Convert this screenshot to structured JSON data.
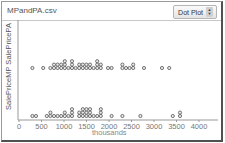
{
  "window": {
    "title": "MPandPA.csv",
    "plot_type_select": {
      "selected": "Dot Plot"
    }
  },
  "chart_data": {
    "type": "scatter",
    "subtype": "dot plot (two stacked attributes)",
    "title": "MPandPA.csv",
    "xlabel": "thousands",
    "ylabel": "SalePriceMP SalePricePA",
    "xlim": [
      0,
      4000
    ],
    "x_ticks": [
      0,
      500,
      1000,
      1500,
      2000,
      2500,
      3000,
      3500,
      4000
    ],
    "grid": false,
    "series": [
      {
        "name": "SalePricePA",
        "values": [
          300,
          500,
          700,
          750,
          800,
          850,
          850,
          900,
          950,
          1000,
          1000,
          1050,
          1100,
          1150,
          1200,
          1200,
          1250,
          1300,
          1350,
          1400,
          1450,
          1500,
          1500,
          1550,
          1600,
          1650,
          1700,
          1750,
          1750,
          1800,
          1800,
          2000,
          2050,
          2300,
          2300,
          2350,
          2450,
          2500,
          2550,
          2800,
          3200,
          3300
        ]
      },
      {
        "name": "SalePriceMP",
        "values": [
          300,
          350,
          650,
          700,
          700,
          800,
          850,
          900,
          1000,
          1050,
          1100,
          1150,
          1200,
          1200,
          1300,
          1350,
          1400,
          1450,
          1450,
          1500,
          1500,
          1500,
          1550,
          1550,
          1600,
          1650,
          1750,
          1800,
          1800,
          1850,
          2050,
          2300,
          2700,
          3400,
          3550,
          3550
        ]
      }
    ]
  },
  "axis": {
    "x_tick_labels": [
      "0",
      "500",
      "1000",
      "1500",
      "2000",
      "2500",
      "3000",
      "3500",
      "4000"
    ],
    "x_label": "thousands",
    "y_label": "SalePriceMP SalePricePA"
  }
}
